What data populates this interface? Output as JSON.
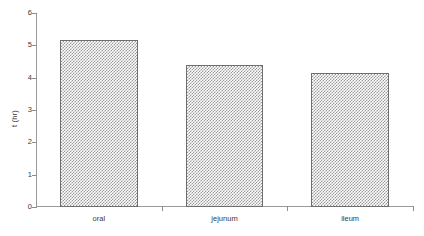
{
  "chart_data": {
    "type": "bar",
    "title": "",
    "subtitle": "",
    "xlabel": "",
    "ylabel": "t (hr)",
    "categories": [
      "oral",
      "jejunum",
      "ileum"
    ],
    "values": [
      5.15,
      4.4,
      4.15
    ],
    "ylim": [
      0,
      6
    ],
    "y_ticks": [
      0,
      1,
      2,
      3,
      4,
      5,
      6
    ],
    "y_tick_labels": [
      "0",
      "1",
      "2",
      "3",
      "4",
      "5",
      "6"
    ],
    "grid": false,
    "legend": false,
    "legend_position": "none",
    "bar_fill": "#9a9a9a",
    "bar_fill_pattern": "50% checkerboard dither",
    "bar_border_color": "#6e6e6e",
    "axis_color": "#9a9a9a",
    "background": "#ffffff",
    "annotations": []
  }
}
